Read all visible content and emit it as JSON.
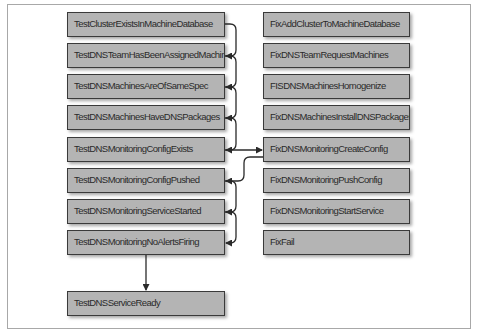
{
  "diagram": {
    "test_nodes": [
      {
        "id": "t1",
        "label": "TestClusterExistsInMachineDatabase"
      },
      {
        "id": "t2",
        "label": "TestDNSTeamHasBeenAssignedMachines"
      },
      {
        "id": "t3",
        "label": "TestDNSMachinesAreOfSameSpec"
      },
      {
        "id": "t4",
        "label": "TestDNSMachinesHaveDNSPackages"
      },
      {
        "id": "t5",
        "label": "TestDNSMonitoringConfigExists"
      },
      {
        "id": "t6",
        "label": "TestDNSMonitoringConfigPushed"
      },
      {
        "id": "t7",
        "label": "TestDNSMonitoringServiceStarted"
      },
      {
        "id": "t8",
        "label": "TestDNSMonitoringNoAlertsFiring"
      }
    ],
    "final_node": {
      "id": "t9",
      "label": "TestDNSServiceReady"
    },
    "fix_nodes": [
      {
        "id": "f1",
        "label": "FixAddClusterToMachineDatabase"
      },
      {
        "id": "f2",
        "label": "FixDNSTeamRequestMachines"
      },
      {
        "id": "f3",
        "label": "FISDNSMachinesHomogenize"
      },
      {
        "id": "f4",
        "label": "FixDNSMachinesInstallDNSPackages"
      },
      {
        "id": "f5",
        "label": "FixDNSMonitoringCreateConfig"
      },
      {
        "id": "f6",
        "label": "FixDNSMonitoringPushConfig"
      },
      {
        "id": "f7",
        "label": "FixDNSMonitoringStartService"
      },
      {
        "id": "f8",
        "label": "FixFail"
      }
    ],
    "edges": [
      {
        "from": "t1",
        "to": "t2"
      },
      {
        "from": "t2",
        "to": "t3"
      },
      {
        "from": "t3",
        "to": "t4"
      },
      {
        "from": "t4",
        "to": "t5"
      },
      {
        "from": "t5",
        "to": "f5"
      },
      {
        "from": "f5",
        "to": "t6"
      },
      {
        "from": "t6",
        "to": "t7"
      },
      {
        "from": "t7",
        "to": "t8"
      },
      {
        "from": "t8",
        "to": "t9"
      }
    ]
  }
}
